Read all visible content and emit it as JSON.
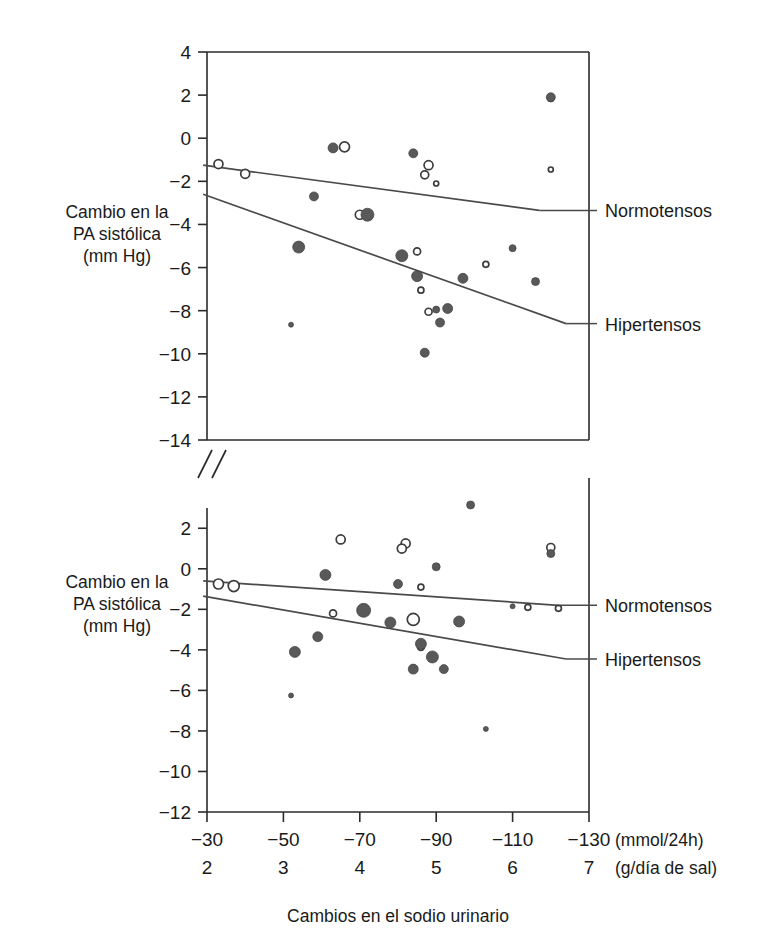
{
  "figure": {
    "y_axis_title_lines": [
      "Cambio en la",
      "PA sistólica",
      "(mm Hg)"
    ],
    "x_axis_title": "Cambios en el sodio urinario",
    "x_unit_primary": "(mmol/24h)",
    "x_unit_secondary": "(g/día de sal)",
    "series_labels": {
      "normotensive": "Normotensos",
      "hypertensive": "Hipertensos"
    },
    "colors": {
      "marker_fill": "#595959",
      "marker_edge": "#3d3d3d",
      "marker_open_fill": "#ffffff",
      "line": "#4a4a4a",
      "axis": "#2b2b2b",
      "text": "#1a1a1a",
      "background": "#ffffff"
    }
  },
  "chart_data": {
    "type": "scatter",
    "title": "",
    "xlabel": "Cambios en el sodio urinario",
    "ylabel": "Cambio en la PA sistólica (mm Hg)",
    "grid": false,
    "legend_position": "right-inline",
    "x_axis": {
      "primary_unit": "(mmol/24h)",
      "primary_ticks": [
        -30,
        -50,
        -70,
        -90,
        -110,
        -130
      ],
      "secondary_unit": "(g/día de sal)",
      "secondary_ticks": [
        2,
        3,
        4,
        5,
        6,
        7
      ],
      "xlim": [
        -30,
        -130
      ]
    },
    "axis_break": true,
    "panels": [
      {
        "name": "upper-panel",
        "ylim": [
          -14,
          4
        ],
        "yticks": [
          4,
          2,
          0,
          -2,
          -4,
          -6,
          -8,
          -10,
          -12,
          -14
        ],
        "series": [
          {
            "name": "Normotensos",
            "marker": "open-circle",
            "regression": {
              "x": [
                -29,
                -117
              ],
              "y": [
                -1.25,
                -3.35
              ]
            },
            "points": [
              {
                "x": -33,
                "y": -1.2,
                "size": 9
              },
              {
                "x": -40,
                "y": -1.65,
                "size": 9
              },
              {
                "x": -66,
                "y": -0.4,
                "size": 10
              },
              {
                "x": -88,
                "y": -1.25,
                "size": 9
              },
              {
                "x": -87,
                "y": -1.7,
                "size": 8
              },
              {
                "x": -90,
                "y": -2.1,
                "size": 5
              },
              {
                "x": -70,
                "y": -3.55,
                "size": 9
              },
              {
                "x": -85,
                "y": -5.25,
                "size": 7
              },
              {
                "x": -103,
                "y": -5.85,
                "size": 6
              },
              {
                "x": -86,
                "y": -7.05,
                "size": 6
              },
              {
                "x": -88,
                "y": -8.05,
                "size": 7
              },
              {
                "x": -120,
                "y": 1.85,
                "size": 6
              },
              {
                "x": -120,
                "y": -1.45,
                "size": 5
              }
            ]
          },
          {
            "name": "Hipertensos",
            "marker": "filled-circle",
            "regression": {
              "x": [
                -29,
                -124
              ],
              "y": [
                -2.6,
                -8.6
              ]
            },
            "points": [
              {
                "x": -63,
                "y": -0.45,
                "size": 10
              },
              {
                "x": -84,
                "y": -0.7,
                "size": 9
              },
              {
                "x": -58,
                "y": -2.7,
                "size": 9
              },
              {
                "x": -72,
                "y": -3.55,
                "size": 13
              },
              {
                "x": -54,
                "y": -5.05,
                "size": 12
              },
              {
                "x": -81,
                "y": -5.45,
                "size": 12
              },
              {
                "x": -110,
                "y": -5.1,
                "size": 7
              },
              {
                "x": -85,
                "y": -6.4,
                "size": 11
              },
              {
                "x": -97,
                "y": -6.5,
                "size": 10
              },
              {
                "x": -116,
                "y": -6.65,
                "size": 8
              },
              {
                "x": -52,
                "y": -8.65,
                "size": 5
              },
              {
                "x": -90,
                "y": -7.95,
                "size": 7
              },
              {
                "x": -93,
                "y": -7.9,
                "size": 10
              },
              {
                "x": -91,
                "y": -8.55,
                "size": 9
              },
              {
                "x": -87,
                "y": -9.95,
                "size": 9
              },
              {
                "x": -120,
                "y": 1.9,
                "size": 9
              }
            ]
          }
        ]
      },
      {
        "name": "lower-panel",
        "ylim": [
          -12,
          3
        ],
        "yticks": [
          2,
          0,
          -2,
          -4,
          -6,
          -8,
          -10,
          -12
        ],
        "series": [
          {
            "name": "Normotensos",
            "marker": "open-circle",
            "regression": {
              "x": [
                -29,
                -122
              ],
              "y": [
                -0.6,
                -1.8
              ]
            },
            "points": [
              {
                "x": -33,
                "y": -0.75,
                "size": 10
              },
              {
                "x": -37,
                "y": -0.85,
                "size": 11
              },
              {
                "x": -65,
                "y": 1.45,
                "size": 9
              },
              {
                "x": -82,
                "y": 1.25,
                "size": 9
              },
              {
                "x": -81,
                "y": 1.0,
                "size": 9
              },
              {
                "x": -86,
                "y": -0.9,
                "size": 6
              },
              {
                "x": -63,
                "y": -2.2,
                "size": 7
              },
              {
                "x": -84,
                "y": -2.5,
                "size": 12
              },
              {
                "x": -86,
                "y": -3.85,
                "size": 7
              },
              {
                "x": -114,
                "y": -1.9,
                "size": 6
              },
              {
                "x": -122,
                "y": -1.95,
                "size": 6
              },
              {
                "x": -120,
                "y": 1.05,
                "size": 8
              }
            ]
          },
          {
            "name": "Hipertensos",
            "marker": "filled-circle",
            "regression": {
              "x": [
                -29,
                -124
              ],
              "y": [
                -1.35,
                -4.45
              ]
            },
            "points": [
              {
                "x": -61,
                "y": -0.3,
                "size": 11
              },
              {
                "x": -80,
                "y": -0.75,
                "size": 9
              },
              {
                "x": -90,
                "y": 0.1,
                "size": 8
              },
              {
                "x": -99,
                "y": 3.15,
                "size": 8
              },
              {
                "x": -120,
                "y": 0.75,
                "size": 8
              },
              {
                "x": -71,
                "y": -2.05,
                "size": 14
              },
              {
                "x": -78,
                "y": -2.65,
                "size": 11
              },
              {
                "x": -96,
                "y": -2.6,
                "size": 11
              },
              {
                "x": -110,
                "y": -1.85,
                "size": 5
              },
              {
                "x": -59,
                "y": -3.35,
                "size": 10
              },
              {
                "x": -86,
                "y": -3.7,
                "size": 11
              },
              {
                "x": -53,
                "y": -4.1,
                "size": 11
              },
              {
                "x": -89,
                "y": -4.35,
                "size": 12
              },
              {
                "x": -84,
                "y": -4.95,
                "size": 10
              },
              {
                "x": -92,
                "y": -4.95,
                "size": 9
              },
              {
                "x": -52,
                "y": -6.25,
                "size": 5
              },
              {
                "x": -103,
                "y": -7.9,
                "size": 5
              }
            ]
          }
        ]
      }
    ]
  }
}
